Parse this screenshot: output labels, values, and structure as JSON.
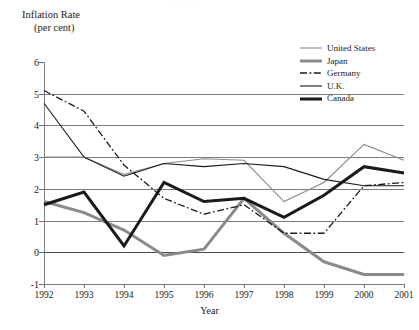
{
  "axis_titles": {
    "y_line1": "Inflation Rate",
    "y_line2": "(per cent)",
    "x": "Year"
  },
  "faint_top_artifact": "— —  — —",
  "legend": {
    "position": "top-right",
    "entries": [
      {
        "label": "United States",
        "style": "solid",
        "width": 1.1,
        "color": "#8a8a8a"
      },
      {
        "label": "Japan",
        "style": "solid",
        "width": 3.0,
        "color": "#8a8a8a"
      },
      {
        "label": "Germany",
        "style": "dash-dot",
        "width": 1.3,
        "color": "#1a1a1a"
      },
      {
        "label": "U.K.",
        "style": "solid",
        "width": 1.1,
        "color": "#1a1a1a"
      },
      {
        "label": "Canada",
        "style": "solid",
        "width": 3.0,
        "color": "#1a1a1a"
      }
    ]
  },
  "chart_data": {
    "type": "line",
    "title": "",
    "xlabel": "Year",
    "ylabel": "Inflation Rate (per cent)",
    "x": [
      1992,
      1993,
      1994,
      1995,
      1996,
      1997,
      1998,
      1999,
      2000,
      2001
    ],
    "xtick_labels": [
      "1992",
      "1993",
      "1994",
      "1995",
      "1996",
      "1997",
      "1998",
      "1999",
      "2000",
      "2001"
    ],
    "ytick_labels": [
      "6",
      "5",
      "4",
      "3",
      "2",
      "1",
      "0",
      "-1"
    ],
    "ylim": [
      -1,
      6
    ],
    "ytick_values": [
      6,
      5,
      4,
      3,
      2,
      1,
      0,
      -1
    ],
    "grid": "horizontal-at-ticks",
    "legend_position": "top-right",
    "series": [
      {
        "name": "United States",
        "values": [
          3.0,
          3.0,
          2.45,
          2.8,
          2.95,
          2.9,
          1.6,
          2.2,
          3.4,
          2.9
        ]
      },
      {
        "name": "Japan",
        "values": [
          1.6,
          1.25,
          0.7,
          -0.1,
          0.1,
          1.7,
          0.6,
          -0.3,
          -0.7,
          -0.7
        ]
      },
      {
        "name": "Germany",
        "values": [
          5.1,
          4.45,
          2.75,
          1.7,
          1.2,
          1.5,
          0.6,
          0.6,
          2.1,
          2.2
        ]
      },
      {
        "name": "U.K.",
        "values": [
          4.7,
          3.0,
          2.4,
          2.8,
          2.7,
          2.8,
          2.7,
          2.3,
          2.1,
          2.1
        ]
      },
      {
        "name": "Canada",
        "values": [
          1.5,
          1.9,
          0.2,
          2.2,
          1.6,
          1.7,
          1.1,
          1.8,
          2.7,
          2.5
        ]
      }
    ]
  }
}
